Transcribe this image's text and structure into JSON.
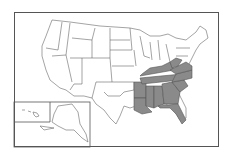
{
  "map": {
    "type": "choropleth",
    "region": "United States",
    "highlighted_region": "Southeastern United States",
    "highlight_color": "#8a8a8a",
    "base_color": "#ffffff",
    "border_color": "#666666",
    "highlighted_states": [
      "Arkansas",
      "Louisiana",
      "Mississippi",
      "Alabama",
      "Tennessee",
      "Kentucky",
      "Georgia",
      "Florida",
      "South Carolina",
      "North Carolina",
      "Virginia",
      "West Virginia"
    ],
    "insets": [
      "Alaska",
      "Hawaii"
    ]
  }
}
